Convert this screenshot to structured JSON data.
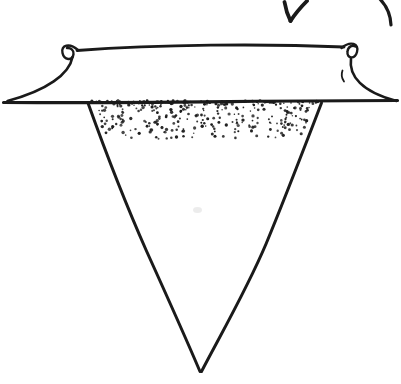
{
  "figure": {
    "parts": {
      "arrow": "rotation-arrow",
      "rim": "flared-rim-with-curled-ends",
      "cone": "inverted-cone",
      "shading": "stipple-dots",
      "smudge": "faint-pencil-smudge"
    }
  },
  "colors": {
    "ink": "#1a1a1a",
    "paper": "#ffffff",
    "smudge": "#d9d9d9"
  },
  "canvas": {
    "width": 401,
    "height": 384
  },
  "stipple": {
    "seed": 90210,
    "count": 340,
    "band_top": 100.5,
    "band_depth": 37,
    "bias": 2.2,
    "inset": 4,
    "r_min": 0.7,
    "r_max": 1.7,
    "triangle": {
      "top_y": 102,
      "tip_y": 372,
      "left_x": 88,
      "right_x": 322,
      "tip_x": 201
    }
  }
}
